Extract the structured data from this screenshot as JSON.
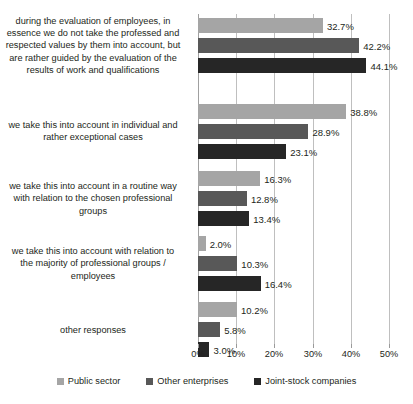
{
  "chart_data": {
    "type": "bar",
    "orientation": "horizontal",
    "title": "",
    "xlabel": "",
    "ylabel": "",
    "xlim": [
      0,
      50
    ],
    "xticks": [
      "0%",
      "10%",
      "20%",
      "30%",
      "40%",
      "50%"
    ],
    "grid": true,
    "legend_position": "bottom",
    "categories": [
      "during the evaluation of employees, in essence we do not take the professed and respected values by them into account, but are rather guided by the evaluation of the results of work and qualifications",
      "we take this into account in individual and rather exceptional cases",
      "we take this into account in a routine way with relation to the chosen professional groups",
      "we take this into account with relation to the majority of professional groups / employees",
      "other responses"
    ],
    "series": [
      {
        "name": "Public sector",
        "color": "#a5a5a5",
        "values": [
          32.7,
          38.8,
          16.3,
          2.0,
          10.2
        ],
        "labels": [
          "32.7%",
          "38.8%",
          "16.3%",
          "2.0%",
          "10.2%"
        ]
      },
      {
        "name": "Other enterprises",
        "color": "#585858",
        "values": [
          42.2,
          28.9,
          12.8,
          10.3,
          5.8
        ],
        "labels": [
          "42.2%",
          "28.9%",
          "12.8%",
          "10.3%",
          "5.8%"
        ]
      },
      {
        "name": "Joint-stock companies",
        "color": "#262626",
        "values": [
          44.1,
          23.1,
          13.4,
          16.4,
          3.0
        ],
        "labels": [
          "44.1%",
          "23.1%",
          "13.4%",
          "16.4%",
          "3.0%"
        ]
      }
    ]
  },
  "legend": {
    "items": [
      {
        "label": "Public sector"
      },
      {
        "label": "Other enterprises"
      },
      {
        "label": "Joint-stock companies"
      }
    ]
  },
  "axis": {
    "ticks": [
      {
        "label": "0%"
      },
      {
        "label": "10%"
      },
      {
        "label": "20%"
      },
      {
        "label": "30%"
      },
      {
        "label": "40%"
      },
      {
        "label": "50%"
      }
    ]
  }
}
